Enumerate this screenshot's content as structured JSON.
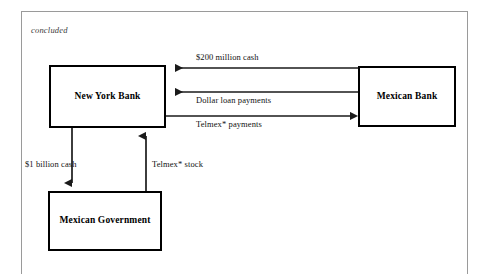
{
  "figure": {
    "caption": "concluded",
    "colors": {
      "node_border": "#000000",
      "node_fill": "#ffffff",
      "connector": "#1a1a1a",
      "frame": "#9a9a9a",
      "text": "#000000"
    }
  },
  "nodes": [
    {
      "id": "new-york-bank",
      "label": "New York Bank"
    },
    {
      "id": "mexican-bank",
      "label": "Mexican Bank"
    },
    {
      "id": "mexican-government",
      "label": "Mexican Government"
    }
  ],
  "edges": [
    {
      "id": "cash-200-million",
      "label": "$200 million cash",
      "from": "mexican-bank",
      "to": "new-york-bank",
      "direction": "right-to-left",
      "orientation": "horizontal"
    },
    {
      "id": "dollar-loan-payments",
      "label": "Dollar loan payments",
      "from": "mexican-bank",
      "to": "new-york-bank",
      "direction": "right-to-left",
      "orientation": "horizontal"
    },
    {
      "id": "telmex-payments",
      "label": "Telmex* payments",
      "from": "new-york-bank",
      "to": "mexican-bank",
      "direction": "left-to-right",
      "orientation": "horizontal"
    },
    {
      "id": "cash-1-billion",
      "label": "$1 billion cash",
      "from": "new-york-bank",
      "to": "mexican-government",
      "direction": "downward",
      "orientation": "vertical"
    },
    {
      "id": "telmex-stock",
      "label": "Telmex* stock",
      "from": "mexican-government",
      "to": "new-york-bank",
      "direction": "upward",
      "orientation": "vertical"
    }
  ]
}
